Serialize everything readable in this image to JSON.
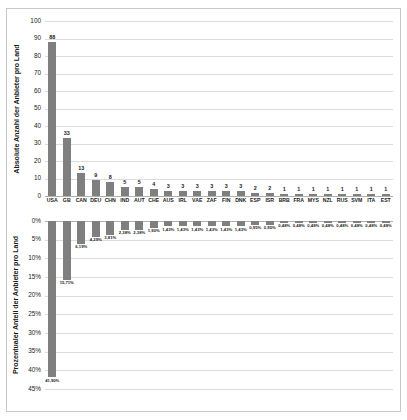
{
  "chart_data": {
    "type": "bar",
    "title": "",
    "subtitle": "",
    "grid": true,
    "legend": "none",
    "categories": [
      "USA",
      "GB",
      "CAN",
      "DEU",
      "CHN",
      "IND",
      "AUT",
      "CHE",
      "AUS",
      "IRL",
      "VAE",
      "ZAF",
      "FIN",
      "DNK",
      "ESP",
      "ISR",
      "BRB",
      "FRA",
      "MYS",
      "NZL",
      "RUS",
      "SVM",
      "ITA",
      "EST"
    ],
    "panels": [
      {
        "id": "absolute",
        "ylabel": "Absolute Anzahl der Anbieter pro Land",
        "xlabel": "",
        "ylim": [
          0,
          100
        ],
        "yticks": [
          0,
          10,
          20,
          30,
          40,
          50,
          60,
          70,
          80,
          90,
          100
        ],
        "ytick_labels": [
          "0",
          "10",
          "20",
          "30",
          "40",
          "50",
          "60",
          "70",
          "80",
          "90",
          "100"
        ],
        "inverted": false,
        "values": [
          88,
          33,
          13,
          9,
          8,
          5,
          5,
          4,
          3,
          3,
          3,
          3,
          3,
          3,
          2,
          2,
          1,
          1,
          1,
          1,
          1,
          1,
          1,
          1
        ],
        "value_labels": [
          "88",
          "33",
          "13",
          "9",
          "8",
          "5",
          "5",
          "4",
          "3",
          "3",
          "3",
          "3",
          "3",
          "3",
          "2",
          "2",
          "1",
          "1",
          "1",
          "1",
          "1",
          "1",
          "1",
          "1"
        ]
      },
      {
        "id": "prozentual",
        "ylabel": "Prozentualer Anteil der Anbieter pro Land",
        "xlabel": "",
        "ylim": [
          0,
          45
        ],
        "yticks": [
          0,
          5,
          10,
          15,
          20,
          25,
          30,
          35,
          40,
          45
        ],
        "ytick_labels": [
          "0%",
          "5%",
          "10%",
          "15%",
          "20%",
          "25%",
          "30%",
          "35%",
          "40%",
          "45%"
        ],
        "inverted": true,
        "values": [
          41.9,
          15.71,
          6.19,
          4.29,
          3.81,
          2.38,
          2.38,
          1.9,
          1.43,
          1.43,
          1.43,
          1.43,
          1.43,
          1.43,
          0.95,
          0.95,
          0.48,
          0.48,
          0.48,
          0.48,
          0.48,
          0.48,
          0.48,
          0.48
        ],
        "value_labels": [
          "41,90%",
          "15,71%",
          "6,19%",
          "4,29%",
          "3,81%",
          "2,38%",
          "2,38%",
          "1,90%",
          "1,43%",
          "1,43%",
          "1,43%",
          "1,43%",
          "1,43%",
          "1,43%",
          "0,95%",
          "0,95%",
          "0,48%",
          "0,48%",
          "0,48%",
          "0,48%",
          "0,48%",
          "0,48%",
          "0,48%",
          "0,48%"
        ]
      }
    ],
    "series_color": "#7f7f7f"
  }
}
